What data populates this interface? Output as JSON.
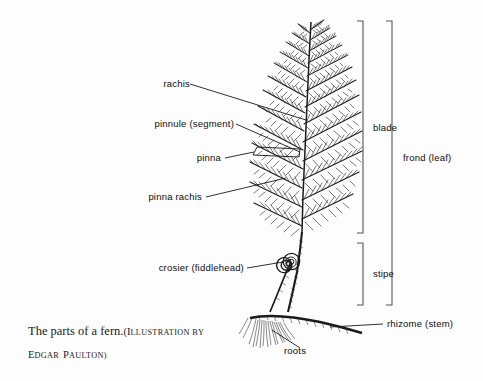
{
  "figure": {
    "background_color": "#fdfdfd",
    "ink_color": "#1a1a1a"
  },
  "caption": {
    "title": "The parts of a fern.",
    "credit_open": "(I",
    "credit_llustration_by": "LLUSTRATION BY",
    "artist_initial_e": "E",
    "artist_dgar": "DGAR",
    "artist_initial_p": "P",
    "artist_aulton": "AULTON)"
  },
  "labels": {
    "rachis": "rachis",
    "pinnule": "pinnule (segment)",
    "pinna": "pinna",
    "pinna_rachis": "pinna rachis",
    "crosier": "crosier (fiddlehead)",
    "blade": "blade",
    "frond": "frond (leaf)",
    "stipe": "stipe",
    "rhizome": "rhizome (stem)",
    "roots": "roots"
  }
}
